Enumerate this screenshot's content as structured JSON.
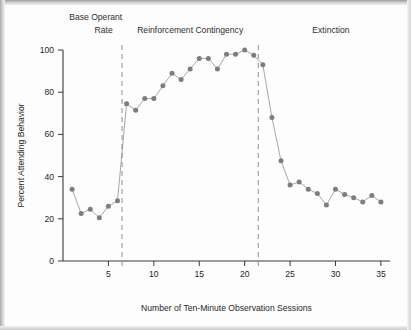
{
  "chart_data": {
    "type": "line",
    "title": "",
    "xlabel": "Number of Ten-Minute Observation Sessions",
    "ylabel": "Percent Attending Behavior",
    "xlim": [
      0,
      36
    ],
    "ylim": [
      0,
      100
    ],
    "grid": false,
    "legend": "none",
    "marker": "filled-circle",
    "series_color": "#7d7d7d",
    "x": [
      1,
      2,
      3,
      4,
      5,
      6,
      7,
      8,
      9,
      10,
      11,
      12,
      13,
      14,
      15,
      16,
      17,
      18,
      19,
      20,
      21,
      22,
      23,
      24,
      25,
      26,
      27,
      28,
      29,
      30,
      31,
      32,
      33,
      34,
      35
    ],
    "values": [
      34,
      22.5,
      24.5,
      20.5,
      26,
      28.5,
      74.5,
      71.5,
      77,
      77,
      83,
      89,
      86,
      91,
      96,
      96,
      91,
      98,
      98,
      100,
      97.5,
      93,
      68,
      47.5,
      36,
      37.5,
      34,
      32,
      26.5,
      34,
      31.5,
      30,
      28,
      31,
      28
    ],
    "xticks": [
      5,
      10,
      15,
      20,
      25,
      30,
      35
    ],
    "xticklabels": [
      "5",
      "10",
      "15",
      "20",
      "25",
      "30",
      "35"
    ],
    "yticks": [
      0,
      20,
      40,
      60,
      80,
      100
    ],
    "yticklabels": [
      "0",
      "20",
      "40",
      "60",
      "80",
      "100"
    ],
    "annotations": [
      {
        "name": "phase-divider-1",
        "type": "vline",
        "x": 6.5,
        "style": "dashed"
      },
      {
        "name": "phase-divider-2",
        "type": "vline",
        "x": 21.5,
        "style": "dashed"
      }
    ],
    "phases": [
      {
        "id": "base-operant-rate",
        "label_line1": "Base Operant",
        "label_line2": "Rate",
        "x_center": 3.6
      },
      {
        "id": "reinforcement-contingency",
        "label_line1": "Reinforcement Contingency",
        "label_line2": "",
        "x_center": 14.0
      },
      {
        "id": "extinction",
        "label_line1": "Extinction",
        "label_line2": "",
        "x_center": 29.5
      }
    ]
  }
}
